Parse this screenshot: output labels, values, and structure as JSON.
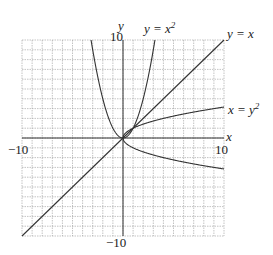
{
  "chart_data": {
    "type": "line",
    "title": "",
    "xlabel": "x",
    "ylabel": "y",
    "xlim": [
      -10,
      10
    ],
    "ylim": [
      -10,
      10
    ],
    "grid": true,
    "grid_step": 1,
    "tick_labels": {
      "x_min": "−10",
      "x_max": "10",
      "y_min": "−10",
      "y_max": "10"
    },
    "series": [
      {
        "name": "y = x^2",
        "label": "y = x",
        "sup": "2",
        "equation": "y = x^2"
      },
      {
        "name": "y = x",
        "label": "y = x",
        "equation": "y = x"
      },
      {
        "name": "x = y^2",
        "label": "x = y",
        "sup": "2",
        "equation": "x = y^2"
      }
    ],
    "legend": "inline annotations at curve ends"
  },
  "colors": {
    "grid": "#9a9a9a",
    "axis": "#333333",
    "curve": "#333333",
    "background": "#ffffff"
  }
}
